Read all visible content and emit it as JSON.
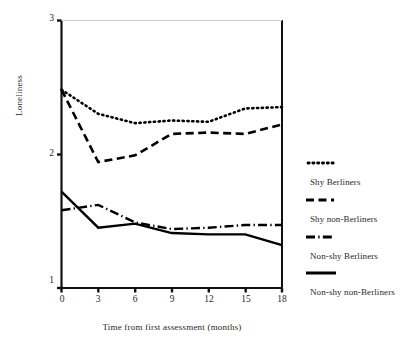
{
  "chart_data": {
    "type": "line",
    "title": "",
    "xlabel": "Time from first assessment (months)",
    "ylabel": "Loneliness",
    "x": [
      0,
      3,
      6,
      9,
      12,
      15,
      18
    ],
    "xlim": [
      0,
      18
    ],
    "ylim": [
      1,
      3
    ],
    "xticks": [
      "0",
      "3",
      "6",
      "9",
      "12",
      "15",
      "18"
    ],
    "yticks": [
      "1",
      "2",
      "3"
    ],
    "grid": false,
    "legend_position": "right",
    "series": [
      {
        "name": "Shy Berliners",
        "style": "dotted",
        "values": [
          2.48,
          2.3,
          2.23,
          2.25,
          2.24,
          2.34,
          2.35
        ]
      },
      {
        "name": "Shy non-Berliners",
        "style": "dashed",
        "values": [
          2.48,
          1.94,
          1.99,
          2.15,
          2.16,
          2.15,
          2.22
        ]
      },
      {
        "name": "Non-shy Berliners",
        "style": "dash-dot",
        "values": [
          1.58,
          1.62,
          1.49,
          1.44,
          1.45,
          1.47,
          1.47
        ]
      },
      {
        "name": "Non-shy non-Berliners",
        "style": "solid",
        "values": [
          1.72,
          1.45,
          1.48,
          1.41,
          1.4,
          1.4,
          1.32
        ]
      }
    ]
  },
  "axes": {
    "y_label": "Loneliness",
    "x_label": "Time from first assessment (months)",
    "y_tick_3": "3",
    "y_tick_2": "2",
    "y_tick_1": "1",
    "x_tick_0": "0",
    "x_tick_3": "3",
    "x_tick_6": "6",
    "x_tick_9": "9",
    "x_tick_12": "12",
    "x_tick_15": "15",
    "x_tick_18": "18"
  },
  "legend": {
    "items": [
      {
        "label": "Shy Berliners",
        "style": "dotted"
      },
      {
        "label": "Shy non-Berliners",
        "style": "dashed"
      },
      {
        "label": "Non-shy Berliners",
        "style": "dash-dot"
      },
      {
        "label": "Non-shy non-Berliners",
        "style": "solid"
      }
    ]
  },
  "colors": {
    "line": "#000000",
    "axis": "#111111",
    "background": "#ffffff"
  }
}
